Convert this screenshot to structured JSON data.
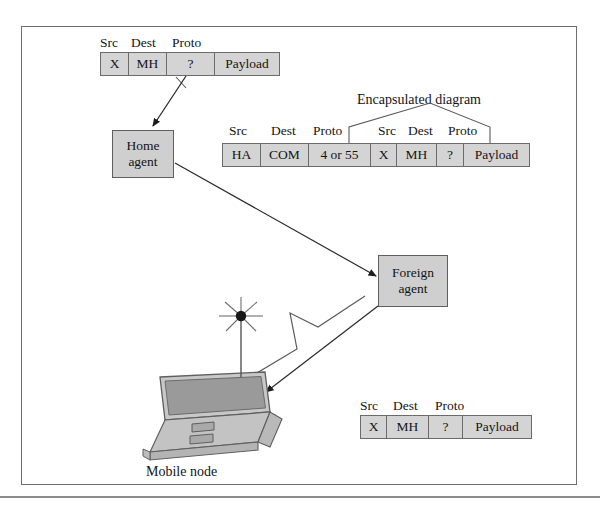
{
  "figure": {
    "title_label": "Mobile IP packet encapsulation diagram",
    "encapsulation_label": "Encapsulated diagram",
    "mobile_node_label": "Mobile node"
  },
  "nodes": {
    "home_agent": {
      "line1": "Home",
      "line2": "agent"
    },
    "foreign_agent": {
      "line1": "Foreign",
      "line2": "agent"
    },
    "mobile_node": {
      "label": "Mobile node"
    }
  },
  "packets": {
    "original": {
      "name": "original-packet",
      "captions": [
        "Src",
        "Dest",
        "Proto"
      ],
      "cells": [
        {
          "label": "X",
          "width": 28
        },
        {
          "label": "MH",
          "width": 38
        },
        {
          "label": "?",
          "width": 48
        },
        {
          "label": "Payload",
          "width": 64
        }
      ]
    },
    "encapsulated": {
      "name": "encapsulated-packet",
      "outer_captions": [
        "Src",
        "Dest",
        "Proto"
      ],
      "inner_captions": [
        "Src",
        "Dest",
        "Proto"
      ],
      "cells": [
        {
          "label": "HA",
          "width": 38
        },
        {
          "label": "COM",
          "width": 48
        },
        {
          "label": "4 or 55",
          "width": 62
        },
        {
          "label": "X",
          "width": 26
        },
        {
          "label": "MH",
          "width": 40
        },
        {
          "label": "?",
          "width": 27
        },
        {
          "label": "Payload",
          "width": 65
        }
      ]
    },
    "delivered": {
      "name": "delivered-packet",
      "captions": [
        "Src",
        "Dest",
        "Proto"
      ],
      "cells": [
        {
          "label": "X",
          "width": 26
        },
        {
          "label": "MH",
          "width": 42
        },
        {
          "label": "?",
          "width": 34
        },
        {
          "label": "Payload",
          "width": 68
        }
      ]
    }
  },
  "colors": {
    "packet_fill": "#d4d4d4",
    "node_fill": "#cfcfcf",
    "stroke": "#5f5f5f",
    "frame": "#6e6e6e",
    "screen_fill": "#9a9a9a",
    "laptop_base": "#c3c3c3"
  }
}
